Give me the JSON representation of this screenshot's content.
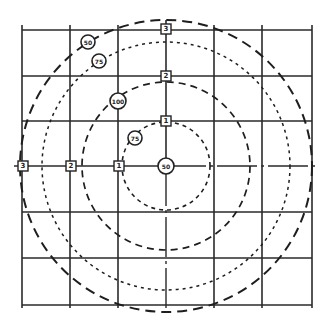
{
  "diagram": {
    "type": "concentric-contour-grid",
    "center": {
      "x": 166,
      "y": 166
    },
    "grid": {
      "x_lines": [
        22,
        70,
        118,
        166,
        214,
        262,
        312
      ],
      "y_lines": [
        30,
        76,
        121,
        166,
        212,
        258,
        305
      ]
    },
    "center_marker": {
      "label": "50"
    },
    "contours": [
      {
        "name": "contour-inner",
        "r": 44,
        "dash": "4 4",
        "width": 1.6
      },
      {
        "name": "contour-second",
        "r": 84,
        "dash": "7 5",
        "width": 1.7
      },
      {
        "name": "contour-third",
        "r": 124,
        "dash": "3 4",
        "width": 1.5
      },
      {
        "name": "contour-outer",
        "r": 146,
        "dash": "10 6",
        "width": 2.0
      }
    ],
    "contour_labels": [
      {
        "text": "75",
        "x": 135,
        "y": 138
      },
      {
        "text": "100",
        "x": 118,
        "y": 101
      },
      {
        "text": "75",
        "x": 99,
        "y": 61
      },
      {
        "text": "50",
        "x": 88,
        "y": 42
      }
    ],
    "distance_markers_vertical": [
      {
        "text": "1",
        "x": 166,
        "y": 121
      },
      {
        "text": "2",
        "x": 166,
        "y": 76
      },
      {
        "text": "3",
        "x": 166,
        "y": 29
      }
    ],
    "distance_markers_horizontal": [
      {
        "text": "1",
        "x": 119,
        "y": 166
      },
      {
        "text": "2",
        "x": 71,
        "y": 166
      },
      {
        "text": "3",
        "x": 23,
        "y": 166
      }
    ]
  }
}
